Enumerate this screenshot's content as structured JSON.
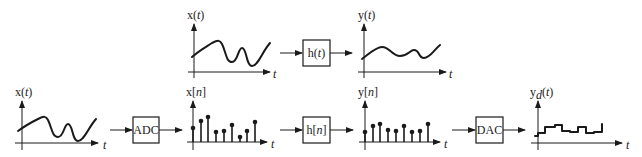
{
  "diagram": {
    "top_row": {
      "input_plot": {
        "label_main": "x(",
        "label_var": "t",
        "label_close": ")",
        "axis_label": "t"
      },
      "system": {
        "label_main": "h(",
        "label_var": "t",
        "label_close": ")"
      },
      "output_plot": {
        "label_main": "y(",
        "label_var": "t",
        "label_close": ")",
        "axis_label": "t"
      }
    },
    "bottom_row": {
      "input_plot": {
        "label_main": "x(",
        "label_var": "t",
        "label_close": ")",
        "axis_label": "t"
      },
      "adc": {
        "label": "ADC"
      },
      "sampled_input": {
        "label_main": "x[",
        "label_var": "n",
        "label_close": "]",
        "axis_label": "t",
        "samples": [
          14,
          21,
          25,
          10,
          11,
          17,
          5,
          11,
          20
        ]
      },
      "digital_system": {
        "label_main": "h[",
        "label_var": "n",
        "label_close": "]"
      },
      "sampled_output": {
        "label_main": "y[",
        "label_var": "n",
        "label_close": "]",
        "axis_label": "t",
        "samples": [
          10,
          16,
          18,
          12,
          11,
          16,
          10,
          11,
          18
        ]
      },
      "dac": {
        "label": "DAC"
      },
      "output_plot": {
        "label_main": "y",
        "label_sub": "d",
        "label_open": "(",
        "label_var": "t",
        "label_close": ")",
        "axis_label": "t"
      }
    },
    "colors": {
      "ink": "#1a1a1a",
      "background": "#ffffff"
    }
  }
}
